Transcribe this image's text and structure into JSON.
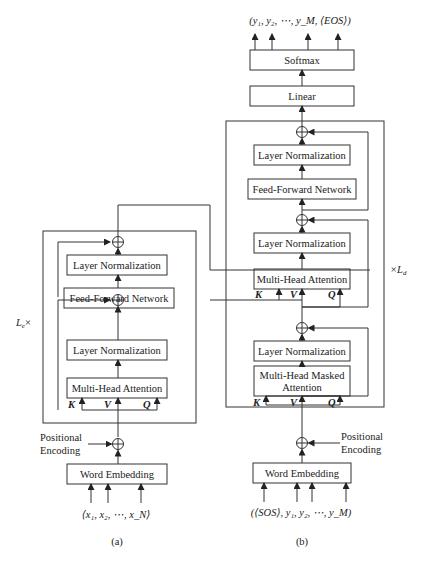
{
  "encoder": {
    "caption": "(a)",
    "repeat_label": "L",
    "repeat_sub": "e",
    "repeat_suffix": "×",
    "blocks": {
      "layer_norm_top": "Layer Normalization",
      "ffn": "Feed-Forward Network",
      "layer_norm_bottom": "Layer Normalization",
      "mha": "Multi-Head Attention",
      "word_embedding": "Word Embedding"
    },
    "kvq": {
      "k": "K",
      "v": "V",
      "q": "Q"
    },
    "positional_encoding": [
      "Positional",
      "Encoding"
    ],
    "input_sequence": "⟨x₁, x₂, ⋯, x_N⟩"
  },
  "decoder": {
    "caption": "(b)",
    "repeat_label": "×L",
    "repeat_sub": "d",
    "blocks": {
      "softmax": "Softmax",
      "linear": "Linear",
      "layer_norm_3": "Layer Normalization",
      "ffn": "Feed-Forward Network",
      "layer_norm_2": "Layer Normalization",
      "mha": "Multi-Head Attention",
      "layer_norm_1": "Layer Normalization",
      "masked_mha_line1": "Multi-Head Masked",
      "masked_mha_line2": "Attention",
      "word_embedding": "Word Embedding"
    },
    "kvq_cross": {
      "k": "K",
      "v": "V",
      "q": "Q"
    },
    "kvq_self": {
      "k": "K",
      "v": "V",
      "q": "Q"
    },
    "positional_encoding": [
      "Positional",
      "Encoding"
    ],
    "input_sequence": "(⟨SOS⟩, y₁, y₂, ⋯, y_M)",
    "output_sequence": "(y₁, y₂, ⋯, y_M, ⟨EOS⟩)"
  },
  "colors": {
    "line": "#333333",
    "text": "#222222",
    "background": "#ffffff"
  }
}
